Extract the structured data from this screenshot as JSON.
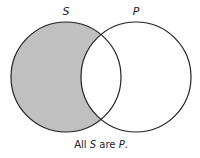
{
  "diagram": {
    "type": "venn",
    "sets": [
      {
        "label": "S",
        "cx": 66,
        "cy": 77,
        "r": 55
      },
      {
        "label": "P",
        "cx": 136,
        "cy": 77,
        "r": 55
      }
    ],
    "shaded_region": "S minus P",
    "colors": {
      "shade": "#c0c0c0",
      "stroke": "#222222",
      "background": "#ffffff"
    },
    "caption": {
      "prefix": "All ",
      "subject": "S",
      "middle": " are ",
      "predicate": "P",
      "suffix": "."
    }
  }
}
